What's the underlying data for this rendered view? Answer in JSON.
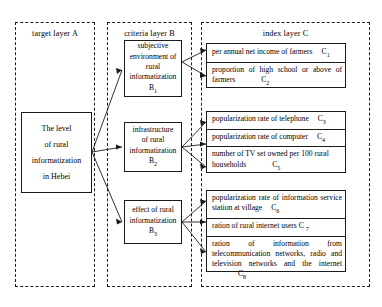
{
  "diagram": {
    "type": "hierarchy-tree",
    "layers": [
      {
        "id": "A",
        "title": "target layer   A"
      },
      {
        "id": "B",
        "title": "criteria layer   B"
      },
      {
        "id": "C",
        "title": "index layer   C"
      }
    ],
    "target": {
      "code": "A",
      "lines": [
        "The level",
        "of rural",
        "informatization",
        "in Hebei"
      ]
    },
    "criteria": [
      {
        "code": "B1",
        "code_base": "B",
        "code_sub": "1",
        "lines": [
          "subjective",
          "environment of",
          "rural",
          "informatization"
        ]
      },
      {
        "code": "B2",
        "code_base": "B",
        "code_sub": "2",
        "lines": [
          "infrastructure",
          "of rural",
          "informatization"
        ]
      },
      {
        "code": "B3",
        "code_base": "B",
        "code_sub": "3",
        "lines": [
          "effect of rural",
          "informatization"
        ]
      }
    ],
    "index_groups": [
      {
        "parent": "B1",
        "rows": [
          {
            "text": "per annual net income of farmers",
            "code_base": "C",
            "code_sub": "1"
          },
          {
            "text": "proportion of high school or above of farmers",
            "code_base": "C",
            "code_sub": "2"
          }
        ]
      },
      {
        "parent": "B2",
        "rows": [
          {
            "text": "popularization rate of telephone",
            "code_base": "C",
            "code_sub": "3"
          },
          {
            "text": "popularization rate of computer",
            "code_base": "C",
            "code_sub": "4"
          },
          {
            "text": "number of TV set owned per 100 rural households",
            "code_base": "C",
            "code_sub": "5"
          }
        ]
      },
      {
        "parent": "B3",
        "rows": [
          {
            "text": "popularization rate of information service station at village",
            "code_base": "C",
            "code_sub": "6"
          },
          {
            "text": "ration of rural internet users",
            "code_base": "C",
            "code_sub": "7"
          },
          {
            "text": "ration of information from telecommunication networks, radio and television networks and the internet",
            "code_base": "C",
            "code_sub": "8"
          }
        ]
      }
    ],
    "colors": {
      "line": "#1a1a1a",
      "background": "#ffffff",
      "text": "#000000"
    }
  }
}
